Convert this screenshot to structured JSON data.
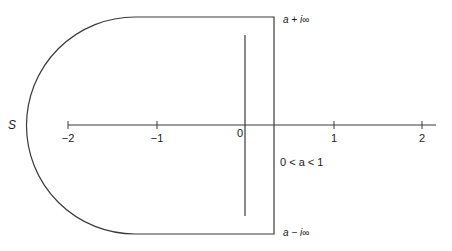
{
  "diagram": {
    "type": "contour-integration",
    "contour_label": "S",
    "axis": {
      "ticks": [
        {
          "label": "−2",
          "x": 68
        },
        {
          "label": "−1",
          "x": 157
        },
        {
          "label": "0",
          "x": 241
        },
        {
          "label": "1",
          "x": 334
        },
        {
          "label": "2",
          "x": 422
        }
      ]
    },
    "labels": {
      "top": "a + i∞",
      "bottom": "a − i∞",
      "condition": "0 < a < 1"
    },
    "colors": {
      "stroke": "#3a3a3a",
      "text": "#1a1a1a",
      "background": "#ffffff"
    }
  }
}
